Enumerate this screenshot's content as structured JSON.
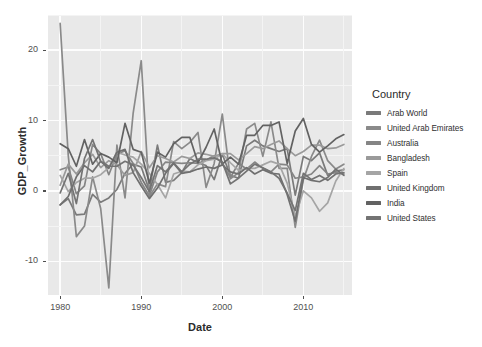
{
  "chart_data": {
    "type": "line",
    "title": "",
    "xlabel": "Date",
    "ylabel": "GDP_Growth",
    "legend_title": "Country",
    "legend_position": "right",
    "grid": true,
    "xlim": [
      1978.5,
      2016.0
    ],
    "ylim": [
      -14.8,
      25.0
    ],
    "xticks": [
      1980,
      1990,
      2000,
      2010
    ],
    "yticks": [
      -10,
      0,
      10,
      20
    ],
    "x": [
      1980,
      1981,
      1982,
      1983,
      1984,
      1985,
      1986,
      1987,
      1988,
      1989,
      1990,
      1991,
      1992,
      1993,
      1994,
      1995,
      1996,
      1997,
      1998,
      1999,
      2000,
      2001,
      2002,
      2003,
      2004,
      2005,
      2006,
      2007,
      2008,
      2009,
      2010,
      2011,
      2012,
      2013,
      2014,
      2015
    ],
    "series": [
      {
        "name": "Arab World",
        "color": "#7a7a7a",
        "values": [
          -2.0,
          -1.1,
          -3.4,
          -3.3,
          -0.5,
          -1.6,
          -1.0,
          0.2,
          2.5,
          3.8,
          3.4,
          0.1,
          6.5,
          1.2,
          1.5,
          2.6,
          4.6,
          4.0,
          3.6,
          1.6,
          5.2,
          2.2,
          1.8,
          6.4,
          7.2,
          6.4,
          6.0,
          5.6,
          6.0,
          -0.6,
          4.9,
          4.3,
          5.4,
          2.2,
          2.8,
          3.0
        ]
      },
      {
        "name": "United Arab Emirates",
        "color": "#8a8a8a",
        "values": [
          23.8,
          5.0,
          -6.5,
          -5.0,
          2.0,
          -2.5,
          -13.8,
          6.5,
          -1.0,
          11.0,
          18.5,
          -0.8,
          1.0,
          0.6,
          7.0,
          6.0,
          6.9,
          8.3,
          0.5,
          3.9,
          10.9,
          1.7,
          2.6,
          8.8,
          9.6,
          4.9,
          9.8,
          3.2,
          3.2,
          -5.2,
          1.6,
          4.9,
          7.2,
          4.3,
          3.1,
          3.8
        ]
      },
      {
        "name": "Australia",
        "color": "#858585",
        "values": [
          3.0,
          3.4,
          -0.4,
          0.7,
          6.6,
          5.3,
          2.3,
          5.2,
          5.7,
          3.9,
          1.2,
          -0.7,
          2.7,
          4.1,
          4.0,
          3.9,
          4.0,
          3.9,
          4.4,
          5.0,
          3.9,
          1.9,
          3.9,
          3.1,
          4.1,
          3.2,
          2.7,
          3.8,
          3.7,
          1.8,
          2.0,
          2.4,
          3.6,
          2.4,
          2.6,
          2.4
        ]
      },
      {
        "name": "Bangladesh",
        "color": "#9a9a9a",
        "values": [
          0.8,
          3.8,
          2.4,
          4.0,
          5.2,
          3.3,
          4.3,
          3.7,
          2.2,
          2.6,
          5.6,
          3.3,
          5.0,
          4.6,
          4.1,
          4.9,
          4.6,
          5.4,
          5.2,
          4.9,
          5.3,
          5.3,
          4.4,
          5.3,
          6.3,
          6.0,
          6.6,
          7.1,
          6.0,
          5.0,
          5.6,
          6.5,
          6.5,
          6.0,
          6.1,
          6.6
        ]
      },
      {
        "name": "Spain",
        "color": "#a5a5a5",
        "values": [
          2.2,
          -0.1,
          1.2,
          1.8,
          1.8,
          2.3,
          3.3,
          5.5,
          5.1,
          4.8,
          3.8,
          2.5,
          0.9,
          -1.0,
          2.4,
          2.8,
          2.7,
          3.7,
          4.3,
          4.5,
          5.3,
          4.0,
          2.9,
          3.2,
          3.2,
          3.7,
          4.2,
          3.8,
          1.1,
          -3.6,
          0.0,
          -1.0,
          -2.9,
          -1.7,
          1.4,
          3.2
        ]
      },
      {
        "name": "United Kingdom",
        "color": "#6f6f6f",
        "values": [
          -2.0,
          -0.8,
          2.0,
          3.6,
          2.7,
          4.2,
          3.2,
          5.5,
          5.9,
          2.6,
          0.7,
          -1.1,
          0.4,
          2.5,
          3.9,
          2.5,
          2.7,
          3.1,
          3.4,
          3.2,
          3.7,
          2.7,
          2.4,
          3.3,
          2.4,
          3.0,
          2.5,
          2.4,
          -0.5,
          -4.3,
          1.9,
          1.5,
          1.3,
          1.9,
          3.1,
          2.2
        ]
      },
      {
        "name": "India",
        "color": "#626262",
        "values": [
          6.7,
          6.0,
          3.5,
          7.3,
          3.8,
          5.3,
          4.8,
          4.0,
          9.6,
          5.9,
          5.5,
          1.1,
          5.5,
          4.8,
          6.7,
          7.6,
          7.6,
          4.0,
          6.2,
          8.8,
          3.8,
          4.8,
          3.8,
          7.9,
          7.9,
          9.3,
          9.3,
          9.8,
          3.9,
          8.5,
          10.3,
          6.6,
          5.5,
          6.4,
          7.4,
          8.0
        ]
      },
      {
        "name": "United States",
        "color": "#737373",
        "values": [
          -0.3,
          2.5,
          -1.8,
          4.6,
          7.3,
          4.2,
          3.5,
          3.5,
          4.2,
          3.7,
          1.9,
          -0.1,
          3.6,
          2.7,
          4.0,
          2.7,
          3.8,
          4.5,
          4.5,
          4.7,
          4.1,
          1.0,
          1.8,
          2.8,
          3.8,
          3.3,
          2.7,
          1.8,
          -0.3,
          -2.8,
          2.5,
          1.6,
          2.2,
          1.5,
          2.4,
          2.6
        ]
      }
    ]
  },
  "axes": {
    "y_title": "GDP_Growth",
    "x_title": "Date",
    "y_tick_labels": [
      "20",
      "10",
      "0",
      "-10"
    ],
    "x_tick_labels": [
      "1980",
      "1990",
      "2000",
      "2010"
    ]
  },
  "legend": {
    "title": "Country",
    "items": [
      {
        "label": "Arab World",
        "color": "#7a7a7a"
      },
      {
        "label": "United Arab Emirates",
        "color": "#8a8a8a"
      },
      {
        "label": "Australia",
        "color": "#858585"
      },
      {
        "label": "Bangladesh",
        "color": "#9a9a9a"
      },
      {
        "label": "Spain",
        "color": "#a5a5a5"
      },
      {
        "label": "United Kingdom",
        "color": "#6f6f6f"
      },
      {
        "label": "India",
        "color": "#626262"
      },
      {
        "label": "United States",
        "color": "#737373"
      }
    ]
  },
  "theme": {
    "panel_background": "#e9e9e9",
    "grid_major_color": "#fdfdfd",
    "grid_minor_color": "#f4f4f4",
    "page_background": "#ffffff",
    "text_color": "#2b2b2b"
  }
}
